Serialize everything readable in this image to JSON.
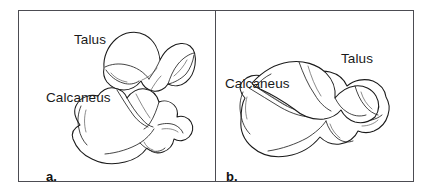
{
  "figure": {
    "domain": "anatomical-line-drawing",
    "width": 433,
    "height": 191,
    "background_color": "#ffffff",
    "frame_color": "#4c4c52",
    "line_color": "#1a1a1a",
    "panels": [
      {
        "caption": "a.",
        "view": "separated-bones",
        "labels": [
          {
            "text": "Talus",
            "name": "talus"
          },
          {
            "text": "Calcaneus",
            "name": "calcaneus"
          }
        ]
      },
      {
        "caption": "b.",
        "view": "articulated-bones",
        "labels": [
          {
            "text": "Talus",
            "name": "talus"
          },
          {
            "text": "Calcaneus",
            "name": "calcaneus"
          }
        ]
      }
    ]
  }
}
